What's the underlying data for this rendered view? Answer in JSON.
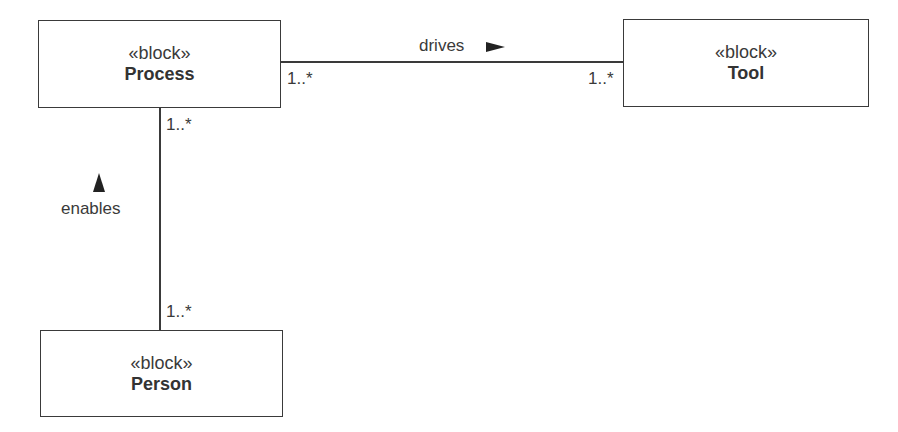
{
  "blocks": {
    "process": {
      "stereotype": "«block»",
      "name": "Process"
    },
    "tool": {
      "stereotype": "«block»",
      "name": "Tool"
    },
    "person": {
      "stereotype": "«block»",
      "name": "Person"
    }
  },
  "associations": {
    "drives": {
      "label": "drives",
      "direction_icon": "triangle-right",
      "source_multiplicity": "1..*",
      "target_multiplicity": "1..*"
    },
    "enables": {
      "label": "enables",
      "direction_icon": "triangle-up",
      "source_multiplicity": "1..*",
      "target_multiplicity": "1..*"
    }
  },
  "colors": {
    "line": "#3a3a3a",
    "text": "#333333",
    "background": "#ffffff"
  }
}
